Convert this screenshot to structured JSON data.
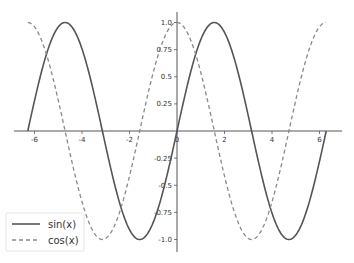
{
  "chart_data": {
    "type": "line",
    "title": "",
    "xlabel": "",
    "ylabel": "",
    "xlim": [
      -6.86,
      6.95
    ],
    "ylim": [
      -1.1,
      1.1
    ],
    "grid": false,
    "spines": "centered",
    "x_ticks": [
      -6,
      -4,
      -2,
      0,
      2,
      4,
      6
    ],
    "x_tick_labels": [
      "-6",
      "-4",
      "-2",
      "0",
      "2",
      "4",
      "6"
    ],
    "y_ticks": [
      1.0,
      0.75,
      0.5,
      0.25,
      -0.25,
      -0.5,
      -0.75,
      -1.0
    ],
    "y_tick_labels": [
      "1.0",
      "0.75",
      "0.5",
      "0.25",
      "-0.25",
      "-0.5",
      "-0.75",
      "-1.0"
    ],
    "x_range": [
      -6.2832,
      6.2832
    ],
    "series": [
      {
        "name": "sin(x)",
        "function": "sin",
        "style": "solid",
        "color": "#555555"
      },
      {
        "name": "cos(x)",
        "function": "cos",
        "style": "dashed",
        "color": "#888888"
      }
    ],
    "legend": {
      "position": "lower left",
      "entries": [
        "sin(x)",
        "cos(x)"
      ]
    }
  }
}
